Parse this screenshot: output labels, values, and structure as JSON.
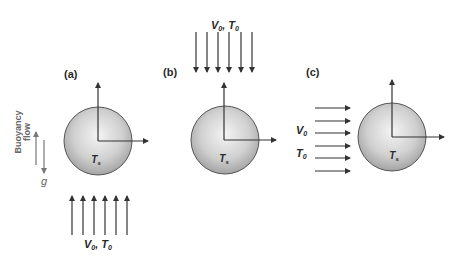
{
  "panels": [
    {
      "label": "(a)",
      "flow_direction": "upward",
      "flow_label_v": "V",
      "flow_label_v_sub": "0",
      "flow_label_sep": ", ",
      "flow_label_t": "T",
      "flow_label_t_sub": "0",
      "sphere_label": "T",
      "sphere_label_sub": "s"
    },
    {
      "label": "(b)",
      "flow_direction": "downward",
      "flow_label_v": "V",
      "flow_label_v_sub": "0",
      "flow_label_sep": ", ",
      "flow_label_t": "T",
      "flow_label_t_sub": "0",
      "sphere_label": "T",
      "sphere_label_sub": "s"
    },
    {
      "label": "(c)",
      "flow_direction": "horizontal-right",
      "flow_label_v": "V",
      "flow_label_v_sub": "0",
      "flow_label_t": "T",
      "flow_label_t_sub": "0",
      "sphere_label": "T",
      "sphere_label_sub": "s"
    }
  ],
  "buoyancy": {
    "line1": "Buoyancy",
    "line2": "flow",
    "gravity_label": "g"
  },
  "colors": {
    "arrow": "#333333",
    "sphere_light": "#f2f2f2",
    "sphere_dark": "#a8a8a8",
    "sphere_edge": "#555555",
    "buoyancy_text": "#777777"
  }
}
